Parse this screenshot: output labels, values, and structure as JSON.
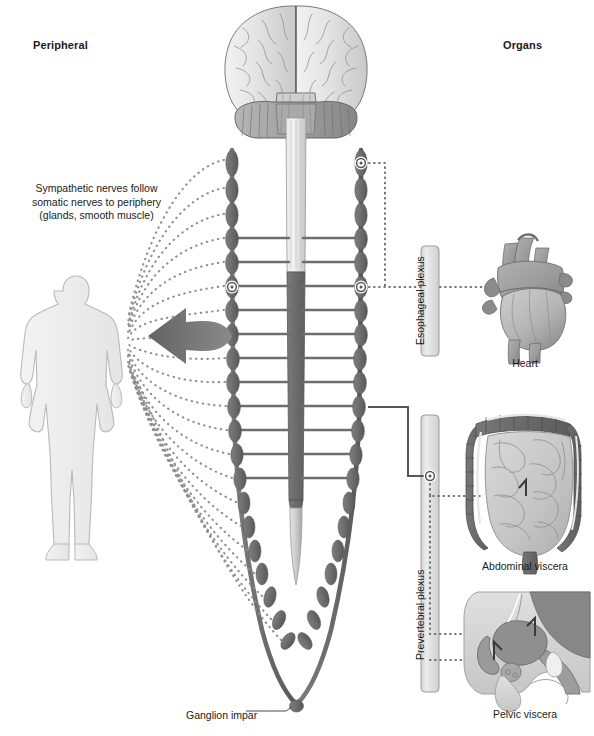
{
  "figure": {
    "type": "anatomical-diagram"
  },
  "headers": {
    "left": "Peripheral",
    "right": "Organs"
  },
  "captions": {
    "sympathetic_line1": "Sympathetic nerves follow",
    "sympathetic_line2": "somatic nerves to periphery",
    "sympathetic_line3": "(glands, smooth muscle)"
  },
  "labels": {
    "esophageal_plexus": "Esophageal plexus",
    "prevertebral_plexus": "Prevertebral plexus",
    "heart": "Heart",
    "abdominal_viscera": "Abdominal viscera",
    "pelvic_viscera": "Pelvic viscera",
    "ganglion_impar": "Ganglion impar"
  },
  "structures": {
    "brain": "brain-posterior-view",
    "spinal_cord": "spinal-cord",
    "body_silhouette": "human-body-silhouette",
    "arrow": "peripheral-distribution-arrow",
    "left_chain": "sympathetic-trunk-left",
    "right_chain": "sympathetic-trunk-right"
  },
  "colors": {
    "ganglion": "#6e6e6e",
    "ganglion_dark": "#5d5d5d",
    "cord_gray": "#6e6e6e",
    "cord_light": "#d8d8d8",
    "plexus_bar": "#e2e2e2",
    "plexus_border": "#9a9a9a",
    "arrow": "#6e6e6e",
    "dotted": "#8a8a8a",
    "organ_dark": "#6f6f6f",
    "organ_mid": "#9d9d9d",
    "organ_light": "#cfcfcf",
    "text": "#1a1a1a",
    "background": "#ffffff"
  },
  "counts": {
    "ganglia_per_chain": 16,
    "rami": 11,
    "fan_lines": 16
  }
}
